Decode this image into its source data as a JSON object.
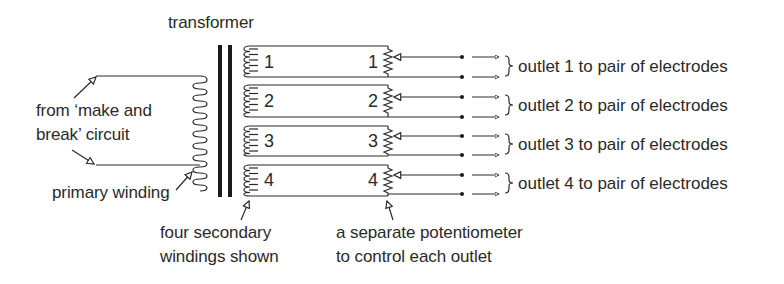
{
  "diagram": {
    "title": "transformer",
    "primary": {
      "source_label_line1": "from ‘make and",
      "source_label_line2": "break’ circuit",
      "winding_label": "primary winding"
    },
    "secondaries": {
      "label_line1": "four secondary",
      "label_line2": "windings shown",
      "windings": [
        {
          "left_number": "1",
          "right_number": "1",
          "outlet_label": "outlet 1 to pair of electrodes"
        },
        {
          "left_number": "2",
          "right_number": "2",
          "outlet_label": "outlet 2 to pair of electrodes"
        },
        {
          "left_number": "3",
          "right_number": "3",
          "outlet_label": "outlet 3 to pair of electrodes"
        },
        {
          "left_number": "4",
          "right_number": "4",
          "outlet_label": "outlet 4 to pair of electrodes"
        }
      ]
    },
    "potentiometer": {
      "label_line1": "a separate potentiometer",
      "label_line2": "to control each outlet"
    },
    "colors": {
      "ink": "#2a2a2a",
      "background": "#ffffff"
    }
  }
}
